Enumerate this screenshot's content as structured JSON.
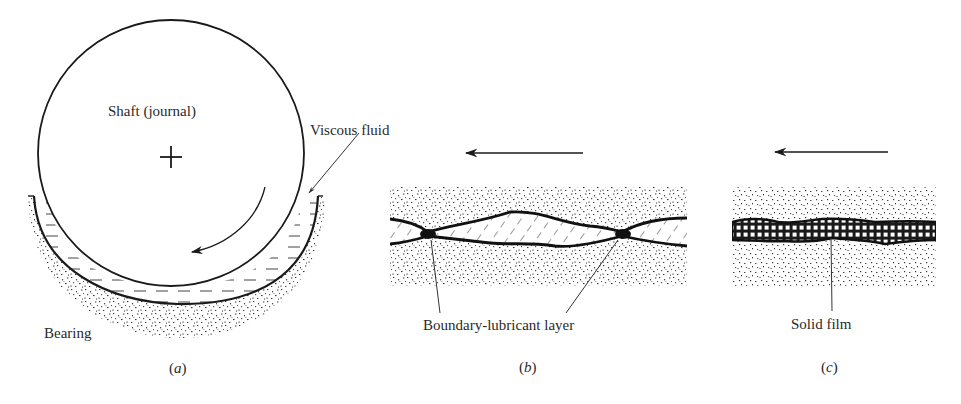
{
  "figure": {
    "panels": [
      {
        "id": "a",
        "caption_letter": "a",
        "title": "Hydrodynamic (full-film) lubrication of a journal bearing",
        "labels": {
          "shaft": "Shaft (journal)",
          "fluid": "Viscous fluid",
          "bearing": "Bearing"
        },
        "elements": [
          "shaft-circle",
          "center-cross",
          "rotation-arrow",
          "fluid-film",
          "bearing-shell"
        ]
      },
      {
        "id": "b",
        "caption_letter": "b",
        "labels": {
          "layer": "Boundary-lubricant layer"
        },
        "motion_direction": "left",
        "elements": [
          "upper-surface",
          "lower-surface",
          "hatched-lubricant",
          "asperity-contacts",
          "motion-arrow"
        ]
      },
      {
        "id": "c",
        "caption_letter": "c",
        "labels": {
          "film": "Solid film"
        },
        "motion_direction": "left",
        "elements": [
          "upper-surface",
          "lower-surface",
          "gridded-solid-film",
          "motion-arrow"
        ]
      }
    ],
    "colors": {
      "ink": "#1a1a1a",
      "stipple": "#3a3a3a",
      "background": "#ffffff"
    }
  }
}
